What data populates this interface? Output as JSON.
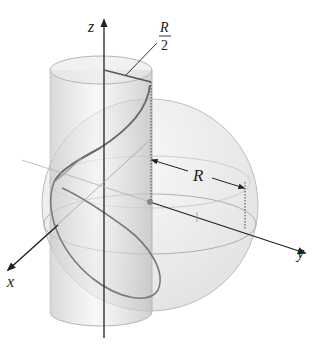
{
  "figure": {
    "labels": {
      "z_axis": "z",
      "x_axis": "x",
      "y_axis": "y",
      "radius": "R",
      "half_radius_num": "R",
      "half_radius_den": "2"
    },
    "elements": [
      {
        "name": "sphere",
        "description": "sphere of radius R centered at origin"
      },
      {
        "name": "cylinder",
        "description": "vertical cylinder of radius R/2"
      },
      {
        "name": "intersection-curve",
        "description": "curve of intersection of cylinder and sphere"
      }
    ],
    "colors": {
      "axis": "#222222",
      "curve": "#6f6f6f",
      "sphere_fill": "#d9d9d9",
      "cylinder_fill": "#cfcfcf",
      "guide": "#9a9a9a"
    }
  }
}
